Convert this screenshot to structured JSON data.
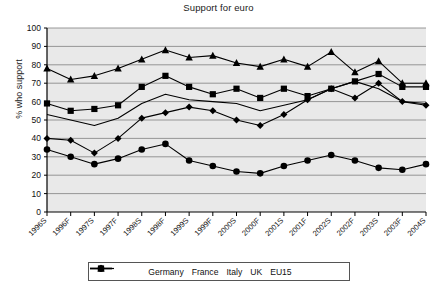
{
  "chart_data": {
    "type": "line",
    "title": "Support for euro",
    "xlabel": "",
    "ylabel": "% who support",
    "ylim": [
      0,
      100
    ],
    "ytick_step": 10,
    "yticks": [
      0,
      10,
      20,
      30,
      40,
      50,
      60,
      70,
      80,
      90,
      100
    ],
    "grid": true,
    "legend_position": "bottom",
    "categories": [
      "1996S",
      "1996F",
      "1997S",
      "1997F",
      "1998S",
      "1998F",
      "1999S",
      "1999F",
      "2000S",
      "2000F",
      "2001S",
      "2001F",
      "2002S",
      "2002F",
      "2003S",
      "2003F",
      "2004S"
    ],
    "series": [
      {
        "name": "Germany",
        "marker": "diamond",
        "color": "#000000",
        "values": [
          40,
          39,
          32,
          40,
          51,
          54,
          57,
          55,
          50,
          47,
          53,
          61,
          67,
          62,
          70,
          60,
          58
        ]
      },
      {
        "name": "France",
        "marker": "square",
        "color": "#000000",
        "values": [
          59,
          55,
          56,
          58,
          68,
          74,
          68,
          64,
          67,
          62,
          67,
          63,
          67,
          71,
          75,
          68,
          68
        ]
      },
      {
        "name": "Italy",
        "marker": "triangle",
        "color": "#000000",
        "values": [
          78,
          72,
          74,
          78,
          83,
          88,
          84,
          85,
          81,
          79,
          83,
          79,
          87,
          76,
          82,
          70,
          70
        ]
      },
      {
        "name": "UK",
        "marker": "circle",
        "color": "#000000",
        "values": [
          34,
          30,
          26,
          29,
          34,
          37,
          28,
          25,
          22,
          21,
          25,
          28,
          31,
          28,
          24,
          23,
          26
        ]
      },
      {
        "name": "EU15",
        "marker": "none",
        "color": "#000000",
        "values": [
          53,
          50,
          47,
          51,
          59,
          64,
          61,
          60,
          59,
          55,
          58,
          61,
          67,
          71,
          67,
          60,
          59
        ]
      }
    ]
  },
  "legend": {
    "items": [
      {
        "label": "Germany",
        "marker": "diamond"
      },
      {
        "label": "France",
        "marker": "square"
      },
      {
        "label": "Italy",
        "marker": "triangle"
      },
      {
        "label": "UK",
        "marker": "circle"
      },
      {
        "label": "EU15",
        "marker": "none"
      }
    ]
  },
  "style": {
    "plot_background": "#e9e9e9",
    "grid_color": "#808080",
    "axis_color": "#000000",
    "line_color": "#000000"
  }
}
